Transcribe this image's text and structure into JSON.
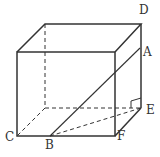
{
  "diagram": {
    "type": "cuboid with diagonal section",
    "labels": {
      "A": "A",
      "B": "B",
      "C": "C",
      "D": "D",
      "E": "E",
      "F": "F"
    },
    "stroke_color": "#333333"
  }
}
